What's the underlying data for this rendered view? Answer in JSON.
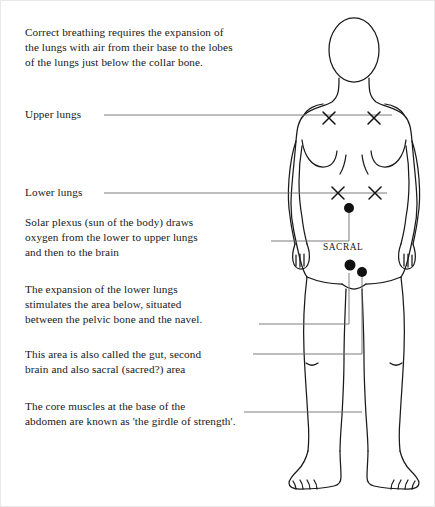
{
  "document": {
    "title": "Correct breathing diagram",
    "background_color": "#ffffff",
    "ink_color": "#181818",
    "leader_line_color": "#6e6e6e"
  },
  "body_figure": {
    "name": "front-facing human body outline",
    "outline_color": "#1a1a1a",
    "marker_color": "#111111"
  },
  "paragraphs": {
    "intro": "Correct breathing requires the expansion of\nthe lungs with air from their base to the lobes\nof the lungs just below the collar bone.",
    "upper_lungs": "Upper lungs",
    "lower_lungs": "Lower lungs",
    "solar_plexus": "Solar plexus (sun of the body) draws\noxygen from the lower to upper lungs\nand then to the brain",
    "expansion": "The expansion of the lower lungs\nstimulates the area below, situated\nbetween the pelvic bone and the navel.",
    "gut": "This area is also called the gut, second\nbrain and also sacral (sacred?) area",
    "core": "The core muscles at the base of the\nabdomen are known as 'the girdle of strength'."
  },
  "labels": {
    "sacral": "SACRAL"
  },
  "markers": {
    "upper_lungs_x": [
      {
        "x": 328,
        "y": 117
      },
      {
        "x": 373,
        "y": 117
      }
    ],
    "lower_lungs_x": [
      {
        "x": 337,
        "y": 192
      },
      {
        "x": 374,
        "y": 192
      }
    ],
    "solar_plexus_dot": {
      "x": 348,
      "y": 207
    },
    "sacral_dots": [
      {
        "x": 349,
        "y": 264
      },
      {
        "x": 361,
        "y": 271
      }
    ]
  },
  "leader_lines": [
    {
      "name": "upper-lungs-leader",
      "points": "103,114 391,114"
    },
    {
      "name": "lower-lungs-leader",
      "points": "103,192 386,192"
    },
    {
      "name": "solar-plexus-leader",
      "points": "270,240 348,240 348,209"
    },
    {
      "name": "expansion-leader",
      "points": "258,323 348,323 348,272"
    },
    {
      "name": "gut-leader",
      "points": "252,353 361,353 361,275"
    },
    {
      "name": "core-leader",
      "points": "243,411 361,411"
    }
  ]
}
